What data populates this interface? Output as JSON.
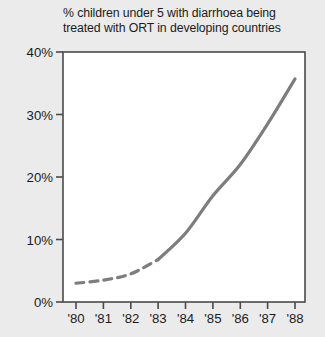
{
  "chart_data": {
    "type": "line",
    "title": "% children under 5 with diarrhoea being treated with ORT in developing countries",
    "title_lines": [
      "% children under 5 with diarrhoea being",
      "treated with ORT in developing countries"
    ],
    "xlabel": "",
    "ylabel": "",
    "categories": [
      "'80",
      "'81",
      "'82",
      "'83",
      "'84",
      "'85",
      "'86",
      "'87",
      "'88"
    ],
    "x": [
      1980,
      1981,
      1982,
      1983,
      1984,
      1985,
      1986,
      1987,
      1988
    ],
    "values": [
      3.0,
      3.5,
      4.5,
      6.8,
      11.0,
      17.0,
      22.0,
      28.5,
      35.7
    ],
    "series": [
      {
        "name": "% children under 5 treated with ORT",
        "values": [
          3.0,
          3.5,
          4.5,
          6.8,
          11.0,
          17.0,
          22.0,
          28.5,
          35.7
        ],
        "color": "#7d7d7d",
        "line_width": 3.2,
        "segments": [
          {
            "style": "dashed",
            "from_index": 0,
            "to_index": 3,
            "note": "estimated data 1980-1983"
          },
          {
            "style": "solid",
            "from_index": 3,
            "to_index": 8,
            "note": "reported data 1983-1988"
          }
        ]
      }
    ],
    "ylim": [
      0,
      40
    ],
    "yticks": [
      0,
      10,
      20,
      30,
      40
    ],
    "ytick_labels": [
      "0%",
      "10%",
      "20%",
      "30%",
      "40%"
    ],
    "xtick_labels": [
      "'80",
      "'81",
      "'82",
      "'83",
      "'84",
      "'85",
      "'86",
      "'87",
      "'88"
    ],
    "grid": false,
    "legend": "none",
    "annotations": []
  },
  "colors": {
    "background": "#ebebeb",
    "plot_background": "#ffffff",
    "axis": "#4a4a4a",
    "line": "#7d7d7d",
    "text": "#1b1b1b"
  }
}
